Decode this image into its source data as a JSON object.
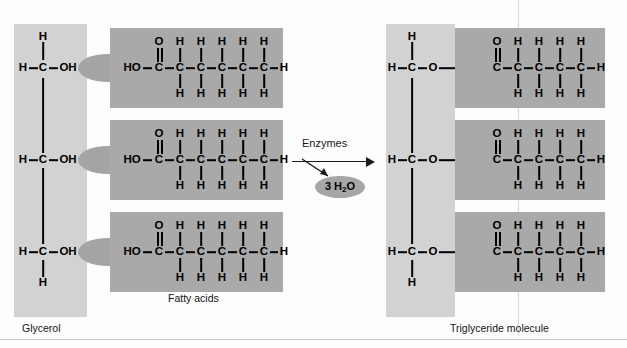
{
  "figure": {
    "colors": {
      "glycerol_block": "#d2d2d2",
      "acyl_block": "#a9a9a9",
      "link_ellipse": "#a4a4a4",
      "water_ellipse": "#a6a6a6",
      "bond": "#000000",
      "background": "#fdfdfd"
    }
  },
  "captions": {
    "glycerol": "Glycerol",
    "fatty_acids": "Fatty acids",
    "triglyceride": "Triglyceride molecule"
  },
  "reaction": {
    "enzymes_label": "Enzymes",
    "byproduct_count": "3",
    "byproduct_formula_prefix": "H",
    "byproduct_subscript": "2",
    "byproduct_suffix": "O",
    "byproduct_label": "3 H2O"
  },
  "atoms": {
    "H": "H",
    "C": "C",
    "O": "O",
    "OH": "OH",
    "HO": "HO",
    "dash": "–"
  },
  "left": {
    "glycerol_rows": [
      {
        "top_h": "H",
        "left_h": "H",
        "carbon": "C",
        "hydroxyl": "OH",
        "bottom_h": ""
      },
      {
        "top_h": "",
        "left_h": "H",
        "carbon": "C",
        "hydroxyl": "OH",
        "bottom_h": ""
      },
      {
        "top_h": "",
        "left_h": "H",
        "carbon": "C",
        "hydroxyl": "OH",
        "bottom_h": "H"
      }
    ],
    "fatty_acid": {
      "head": "HO",
      "carbonyl_o": "O",
      "carbons": [
        "C",
        "C",
        "C",
        "C",
        "C",
        "C"
      ],
      "upper_h": [
        "H",
        "H",
        "H",
        "H",
        "H"
      ],
      "lower_h": [
        "H",
        "H",
        "H",
        "H",
        "H"
      ],
      "terminal_h": "H"
    }
  },
  "right": {
    "glycerol_rows": [
      {
        "top_h": "H",
        "left_h": "H",
        "carbon": "C",
        "ester_o": "O",
        "bottom_h": ""
      },
      {
        "top_h": "",
        "left_h": "H",
        "carbon": "C",
        "ester_o": "O",
        "bottom_h": ""
      },
      {
        "top_h": "",
        "left_h": "H",
        "carbon": "C",
        "ester_o": "O",
        "bottom_h": "H"
      }
    ],
    "acyl_chain": {
      "carbonyl_o": "O",
      "carbons": [
        "C",
        "C",
        "C",
        "C",
        "C",
        "C"
      ],
      "upper_h": [
        "H",
        "H",
        "H",
        "H",
        "H"
      ],
      "lower_h": [
        "H",
        "H",
        "H",
        "H",
        "H"
      ],
      "terminal_h": "H"
    }
  }
}
